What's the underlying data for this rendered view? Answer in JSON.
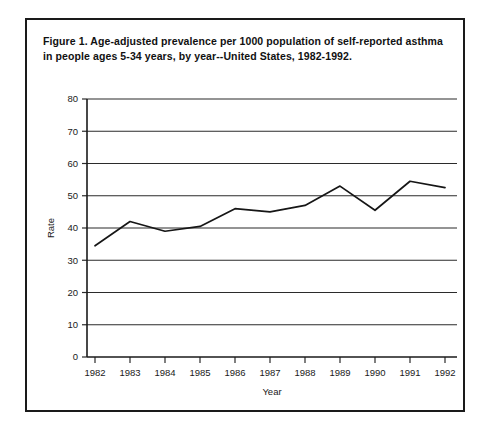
{
  "figure": {
    "caption": "Figure 1.  Age-adjusted prevalence per 1000 population of self-reported asthma in people ages 5-34 years, by year--United States, 1982-1992."
  },
  "chart_data": {
    "type": "line",
    "title": "",
    "xlabel": "Year",
    "ylabel": "Rate",
    "categories": [
      "1982",
      "1983",
      "1984",
      "1985",
      "1986",
      "1987",
      "1988",
      "1989",
      "1990",
      "1991",
      "1992"
    ],
    "values": [
      34.5,
      42.0,
      39.0,
      40.5,
      46.0,
      45.0,
      47.0,
      53.0,
      45.5,
      54.5,
      52.5
    ],
    "series": [
      {
        "name": "Asthma prevalence rate",
        "values": [
          34.5,
          42.0,
          39.0,
          40.5,
          46.0,
          45.0,
          47.0,
          53.0,
          45.5,
          54.5,
          52.5
        ]
      }
    ],
    "ylim": [
      0,
      80
    ],
    "yticks": [
      0,
      10,
      20,
      30,
      40,
      50,
      60,
      70,
      80
    ],
    "ytick_labels": [
      "0",
      "10",
      "20",
      "30",
      "40",
      "50",
      "60",
      "70",
      "80"
    ],
    "xtick_labels": [
      "1982",
      "1983",
      "1984",
      "1985",
      "1986",
      "1987",
      "1988",
      "1989",
      "1990",
      "1991",
      "1992"
    ],
    "grid": true,
    "legend": "none",
    "line_color": "#161616"
  }
}
